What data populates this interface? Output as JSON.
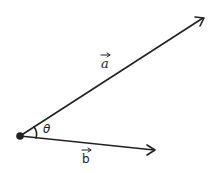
{
  "diagram": {
    "vector_a": {
      "label": "a",
      "color": "#222222"
    },
    "vector_b": {
      "label": "b",
      "color": "#222222"
    },
    "angle": {
      "label": "θ"
    },
    "origin_point": {
      "color": "#222222"
    }
  }
}
